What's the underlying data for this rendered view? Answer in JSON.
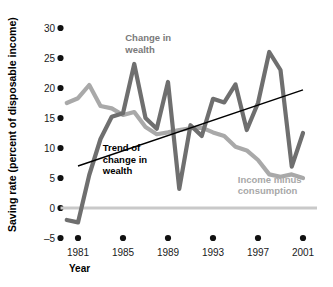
{
  "chart_data": {
    "type": "line",
    "title": "",
    "xlabel": "Year",
    "ylabel": "Saving rate (percent of disposable income)",
    "xlim": [
      1980,
      2001
    ],
    "ylim": [
      -5,
      30
    ],
    "xticks": [
      1981,
      1985,
      1989,
      1993,
      1997,
      2001
    ],
    "xtick_labels": [
      "1981",
      "1985",
      "1989",
      "1993",
      "1997",
      "2001"
    ],
    "yticks": [
      -5,
      0,
      5,
      10,
      15,
      20,
      25,
      30
    ],
    "ytick_labels": [
      "–5",
      "0",
      "5",
      "10",
      "15",
      "20",
      "25",
      "30"
    ],
    "grid": false,
    "legend_position": "inline-annotations",
    "zero_line": 0,
    "x": [
      1980,
      1981,
      1982,
      1983,
      1984,
      1985,
      1986,
      1987,
      1988,
      1989,
      1990,
      1991,
      1992,
      1993,
      1994,
      1995,
      1996,
      1997,
      1998,
      1999,
      2000,
      2001
    ],
    "series": [
      {
        "name": "Change in wealth",
        "color": "#6f6f6f",
        "values": [
          -2.0,
          -2.4,
          5.5,
          11.5,
          15.2,
          15.8,
          24.0,
          15.0,
          13.2,
          21.0,
          3.2,
          13.8,
          12.0,
          18.2,
          17.6,
          20.6,
          13.0,
          17.5,
          26.0,
          23.0,
          6.9,
          12.5
        ]
      },
      {
        "name": "Income minus consumption",
        "color": "#a9a9a9",
        "values": [
          17.5,
          18.3,
          20.5,
          17.0,
          16.6,
          15.5,
          16.0,
          13.5,
          12.3,
          12.6,
          13.0,
          13.3,
          13.4,
          12.6,
          12.0,
          10.2,
          9.6,
          8.0,
          5.6,
          5.2,
          5.6,
          5.0
        ]
      }
    ],
    "trendline": {
      "name": "Trend of change in wealth",
      "color": "#000000",
      "x_start": 1981,
      "y_start": 7.0,
      "x_end": 2001,
      "y_end": 19.7
    },
    "annotations": [
      {
        "id": "change-in-wealth",
        "text_lines": [
          "Change in",
          "wealth"
        ],
        "color": "#7a7a7a",
        "x": 1985.2,
        "y": 27.8
      },
      {
        "id": "trend-of-change-in-wealth",
        "text_lines": [
          "Trend of",
          "change in",
          "wealth"
        ],
        "color": "#000000",
        "x": 1983.2,
        "y": 9.5
      },
      {
        "id": "income-minus-consumption",
        "text_lines": [
          "Income minus",
          "consumption"
        ],
        "color": "#a8a8a8",
        "x": 1995.2,
        "y": 4.2
      }
    ]
  },
  "axis": {
    "y_title": "Saving rate (percent of disposable income)",
    "x_title": "Year"
  }
}
